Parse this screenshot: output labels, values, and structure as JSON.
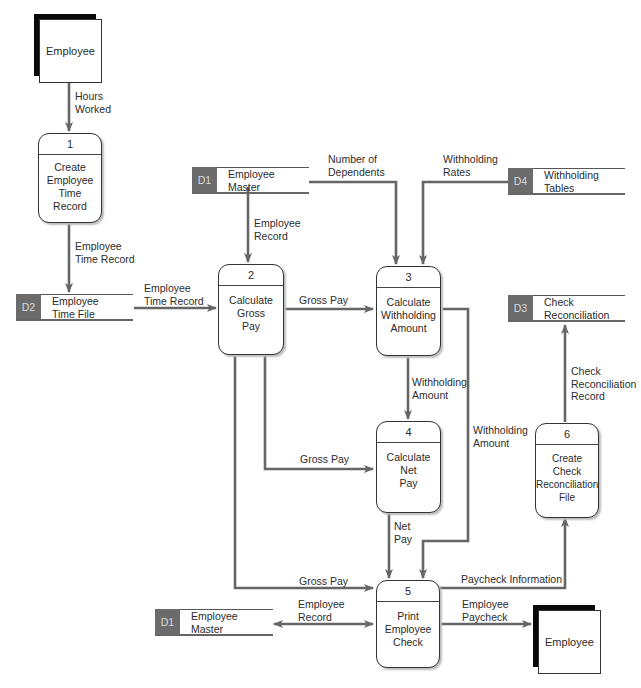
{
  "diagram": {
    "type": "data flow diagram",
    "colors": {
      "line": "#666666",
      "store_id_bg": "#6b6b6b",
      "entity_shadow": "#0a0a0a"
    },
    "entities": [
      {
        "id": "e1",
        "label": "Employee"
      },
      {
        "id": "e2",
        "label": "Employee"
      }
    ],
    "processes": [
      {
        "number": "1",
        "name": "Create\nEmployee\nTime\nRecord"
      },
      {
        "number": "2",
        "name": "Calculate\nGross\nPay"
      },
      {
        "number": "3",
        "name": "Calculate\nWithholding\nAmount"
      },
      {
        "number": "4",
        "name": "Calculate\nNet\nPay"
      },
      {
        "number": "5",
        "name": "Print\nEmployee\nCheck"
      },
      {
        "number": "6",
        "name": "Create\nCheck\nReconciliation\nFile"
      }
    ],
    "stores": [
      {
        "id": "D1",
        "name": "Employee\nMaster"
      },
      {
        "id": "D4",
        "name": "Withholding\nTables"
      },
      {
        "id": "D2",
        "name": "Employee\nTime File"
      },
      {
        "id": "D3",
        "name": "Check\nReconciliation"
      },
      {
        "id": "D1",
        "name": "Employee\nMaster"
      }
    ],
    "flows": [
      {
        "label": "Hours\nWorked"
      },
      {
        "label": "Employee\nTime Record"
      },
      {
        "label": "Employee\nTime Record"
      },
      {
        "label": "Employee\nRecord"
      },
      {
        "label": "Number of\nDependents"
      },
      {
        "label": "Withholding\nRates"
      },
      {
        "label": "Gross Pay"
      },
      {
        "label": "Withholding\nAmount"
      },
      {
        "label": "Gross Pay"
      },
      {
        "label": "Withholding\nAmount"
      },
      {
        "label": "Net\nPay"
      },
      {
        "label": "Gross Pay"
      },
      {
        "label": "Employee\nRecord"
      },
      {
        "label": "Paycheck Information"
      },
      {
        "label": "Employee\nPaycheck"
      },
      {
        "label": "Check\nReconciliation\nRecord"
      }
    ]
  }
}
